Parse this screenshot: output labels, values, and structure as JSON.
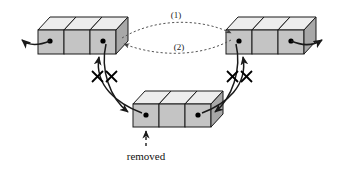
{
  "diagram": {
    "type": "linked-list-node-removal-diagram",
    "background_color": "#ffffff",
    "labels": {
      "pointer_1": "(1)",
      "pointer_2": "(2)",
      "removed": "removed"
    },
    "colors": {
      "box_front_face": "#c4c4c4",
      "box_top_face": "#ededed",
      "box_side_face": "#a8a8a8",
      "outline": "#1a1a1a",
      "node_dot": "#000000",
      "arrow": "#1a1a1a",
      "dashed_arrow": "#555555",
      "text": "#111111"
    },
    "nodes": [
      {
        "id": "left-block",
        "name": "left-node-block",
        "cells": 3,
        "dot_cells": [
          1,
          3
        ],
        "position": "top-left"
      },
      {
        "id": "right-block",
        "name": "right-node-block",
        "cells": 3,
        "dot_cells": [
          1,
          3
        ],
        "position": "top-right"
      },
      {
        "id": "bottom-block",
        "name": "removed-node-block",
        "cells": 3,
        "dot_cells": [
          1,
          3
        ],
        "position": "bottom-center"
      }
    ],
    "connections": [
      {
        "name": "left-outgoing-external",
        "style": "solid",
        "crossed_out": false,
        "from": "left-block-cell-1",
        "to": "off-canvas-left"
      },
      {
        "name": "right-outgoing-external",
        "style": "solid",
        "crossed_out": false,
        "from": "right-block-cell-3",
        "to": "off-canvas-right"
      },
      {
        "name": "relink-forward",
        "label": "(1)",
        "style": "dashed",
        "crossed_out": false,
        "from": "left-block",
        "to": "right-block"
      },
      {
        "name": "relink-backward",
        "label": "(2)",
        "style": "dashed",
        "crossed_out": false,
        "from": "right-block",
        "to": "left-block"
      },
      {
        "name": "left-to-removed",
        "style": "solid",
        "crossed_out": true,
        "from": "left-block-cell-3",
        "to": "bottom-block-cell-1"
      },
      {
        "name": "removed-to-left",
        "style": "solid",
        "crossed_out": true,
        "from": "bottom-block-cell-1",
        "to": "left-block-cell-3"
      },
      {
        "name": "right-to-removed",
        "style": "solid",
        "crossed_out": true,
        "from": "right-block-cell-1",
        "to": "bottom-block-cell-3"
      },
      {
        "name": "removed-to-right",
        "style": "solid",
        "crossed_out": true,
        "from": "bottom-block-cell-3",
        "to": "right-block-cell-1"
      },
      {
        "name": "removed-annotation-pointer",
        "style": "dashed",
        "crossed_out": false,
        "from": "removed-label",
        "to": "bottom-block"
      }
    ]
  }
}
